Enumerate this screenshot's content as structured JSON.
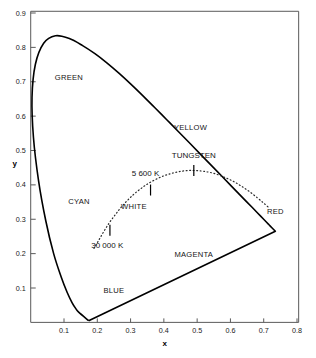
{
  "chart_data": {
    "type": "line",
    "title": "",
    "xlabel": "x",
    "ylabel": "y",
    "xlim": [
      0.0,
      0.8
    ],
    "ylim": [
      0.0,
      0.9
    ],
    "grid": false,
    "legend_position": "none",
    "x_ticks": [
      "0.1",
      "0.2",
      "0.3",
      "0.4",
      "0.5",
      "0.6",
      "0.7",
      "0.8"
    ],
    "x_tick_values": [
      0.1,
      0.2,
      0.3,
      0.4,
      0.5,
      0.6,
      0.7,
      0.8
    ],
    "y_ticks": [
      "0.1",
      "0.2",
      "0.3",
      "0.4",
      "0.5",
      "0.6",
      "0.7",
      "0.8",
      "0.9"
    ],
    "y_tick_values": [
      0.1,
      0.2,
      0.3,
      0.4,
      0.5,
      0.6,
      0.7,
      0.8,
      0.9
    ],
    "series": [
      {
        "name": "spectral-locus-gamut-boundary",
        "style": "solid",
        "points": [
          [
            0.1741,
            0.005
          ],
          [
            0.144,
            0.0297
          ],
          [
            0.1355,
            0.0399
          ],
          [
            0.1241,
            0.0578
          ],
          [
            0.1096,
            0.0868
          ],
          [
            0.0913,
            0.1327
          ],
          [
            0.0687,
            0.2007
          ],
          [
            0.0454,
            0.295
          ],
          [
            0.0235,
            0.4127
          ],
          [
            0.0082,
            0.5384
          ],
          [
            0.0039,
            0.6548
          ],
          [
            0.0139,
            0.7502
          ],
          [
            0.0389,
            0.812
          ],
          [
            0.0743,
            0.8338
          ],
          [
            0.1142,
            0.8262
          ],
          [
            0.1547,
            0.8059
          ],
          [
            0.1929,
            0.7816
          ],
          [
            0.2296,
            0.7543
          ],
          [
            0.2658,
            0.7243
          ],
          [
            0.3016,
            0.6923
          ],
          [
            0.3373,
            0.6589
          ],
          [
            0.3731,
            0.6245
          ],
          [
            0.4087,
            0.5896
          ],
          [
            0.4441,
            0.5547
          ],
          [
            0.4788,
            0.5202
          ],
          [
            0.5125,
            0.4866
          ],
          [
            0.5448,
            0.4544
          ],
          [
            0.5752,
            0.4242
          ],
          [
            0.6029,
            0.3965
          ],
          [
            0.627,
            0.3725
          ],
          [
            0.6482,
            0.3514
          ],
          [
            0.6658,
            0.334
          ],
          [
            0.6801,
            0.3197
          ],
          [
            0.6915,
            0.3083
          ],
          [
            0.7006,
            0.2993
          ],
          [
            0.7079,
            0.292
          ],
          [
            0.714,
            0.2859
          ],
          [
            0.719,
            0.2809
          ],
          [
            0.735,
            0.265
          ]
        ],
        "closing_line_note": "purple line from red corner back to blue corner"
      },
      {
        "name": "planckian-locus-blackbody-curve",
        "style": "dotted",
        "points": [
          [
            0.19,
            0.215
          ],
          [
            0.205,
            0.24
          ],
          [
            0.22,
            0.265
          ],
          [
            0.235,
            0.288
          ],
          [
            0.25,
            0.308
          ],
          [
            0.265,
            0.327
          ],
          [
            0.28,
            0.344
          ],
          [
            0.298,
            0.362
          ],
          [
            0.315,
            0.377
          ],
          [
            0.335,
            0.392
          ],
          [
            0.355,
            0.405
          ],
          [
            0.38,
            0.418
          ],
          [
            0.405,
            0.428
          ],
          [
            0.43,
            0.435
          ],
          [
            0.455,
            0.44
          ],
          [
            0.48,
            0.442
          ],
          [
            0.505,
            0.441
          ],
          [
            0.53,
            0.438
          ],
          [
            0.555,
            0.432
          ],
          [
            0.58,
            0.423
          ],
          [
            0.605,
            0.412
          ],
          [
            0.63,
            0.398
          ],
          [
            0.655,
            0.382
          ],
          [
            0.68,
            0.363
          ],
          [
            0.7,
            0.347
          ],
          [
            0.715,
            0.334
          ]
        ]
      }
    ],
    "annotations": [
      {
        "text": "GREEN",
        "x": 0.115,
        "y": 0.705,
        "kind": "region"
      },
      {
        "text": "CYAN",
        "x": 0.145,
        "y": 0.345,
        "kind": "region"
      },
      {
        "text": "YELLOW",
        "x": 0.48,
        "y": 0.56,
        "kind": "region"
      },
      {
        "text": "RED",
        "x": 0.735,
        "y": 0.315,
        "kind": "region"
      },
      {
        "text": "MAGENTA",
        "x": 0.49,
        "y": 0.19,
        "kind": "region"
      },
      {
        "text": "BLUE",
        "x": 0.25,
        "y": 0.085,
        "kind": "region"
      },
      {
        "text": "WHITE",
        "x": 0.31,
        "y": 0.33,
        "kind": "region"
      },
      {
        "text": "TUNGSTEN",
        "x": 0.49,
        "y": 0.478,
        "kind": "temperature-point"
      },
      {
        "text": "5 600 K",
        "x": 0.345,
        "y": 0.425,
        "kind": "temperature-point"
      },
      {
        "text": "30 000 K",
        "x": 0.23,
        "y": 0.215,
        "kind": "temperature-point"
      }
    ],
    "locus_markers": [
      {
        "label": "TUNGSTEN",
        "x": 0.49,
        "y": 0.442
      },
      {
        "label": "5 600 K",
        "x": 0.36,
        "y": 0.385
      },
      {
        "label": "30 000 K",
        "x": 0.238,
        "y": 0.268
      }
    ]
  },
  "axes": {
    "x_title": "x",
    "y_title": "y"
  },
  "colors": {
    "outline": "#000000",
    "frame": "#5a5a5a",
    "text": "#141414",
    "background": "#ffffff"
  }
}
